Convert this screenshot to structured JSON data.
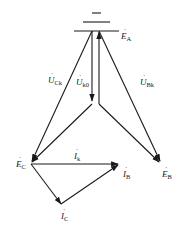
{
  "diagram": {
    "type": "phasor-diagram",
    "nodes": {
      "EA": {
        "label": "E",
        "sub": "A",
        "x": 105,
        "y": 37
      },
      "EB": {
        "label": "E",
        "sub": "B",
        "x": 160,
        "y": 174
      },
      "EC": {
        "label": "E",
        "sub": "C",
        "x": 16,
        "y": 166
      }
    },
    "voltage_labels": {
      "UCk": {
        "label": "U",
        "sub": "Ck"
      },
      "Uk0": {
        "label": "U",
        "sub": "k0"
      },
      "UBk": {
        "label": "U",
        "sub": "Bk"
      }
    },
    "current_labels": {
      "Ik": {
        "label": "I",
        "sub": "k"
      },
      "IB": {
        "label": "I",
        "sub": "B"
      },
      "IC": {
        "label": "I",
        "sub": "C"
      }
    },
    "dot_mark": "·",
    "line_color": "#1a1a1a"
  }
}
